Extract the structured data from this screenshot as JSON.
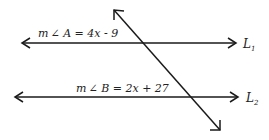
{
  "diagram": {
    "type": "parallel lines cut by a transversal",
    "line_color": "#1a1a1a",
    "lines": [
      {
        "id": "L1",
        "label": "L",
        "subscript": "1",
        "equation": "m∠A = 4x - 9",
        "eq_prefix": "m",
        "angle_symbol": "∠",
        "eq_body": " A = 4x - 9"
      },
      {
        "id": "L2",
        "label": "L",
        "subscript": "2",
        "equation": "m∠B = 2x + 27",
        "eq_prefix": "m",
        "angle_symbol": "∠",
        "eq_body": " B = 2x + 27"
      }
    ],
    "transversal": {
      "label": "transversal"
    }
  }
}
